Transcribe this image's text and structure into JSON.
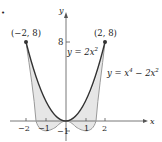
{
  "figure": {
    "bullet": "•",
    "axes": {
      "x_label": "x",
      "y_label": "y",
      "x_ticks": [
        {
          "value": -2,
          "label": "−2"
        },
        {
          "value": -1,
          "label": "−1"
        },
        {
          "value": 1,
          "label": "1"
        },
        {
          "value": 2,
          "label": "2"
        }
      ],
      "y_ticks": [
        {
          "value": 8,
          "label": "8"
        },
        {
          "value": -1,
          "label": "−1"
        }
      ]
    },
    "points": [
      {
        "label": "(−2, 8)",
        "x": -2,
        "y": 8
      },
      {
        "label": "(2, 8)",
        "x": 2,
        "y": 8
      }
    ],
    "curves": [
      {
        "name": "parabola",
        "equation_prefix": "y = 2x",
        "exponent": "2",
        "color": "#333333"
      },
      {
        "name": "quartic",
        "equation_prefix": "y = x",
        "exponent1": "4",
        "middle": " − 2x",
        "exponent2": "2",
        "color": "#999999"
      }
    ],
    "shading_color": "#e6e6e6"
  }
}
